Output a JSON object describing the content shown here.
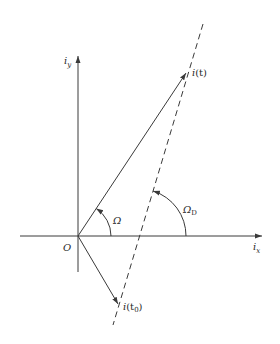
{
  "diagram": {
    "type": "phasor-vector-diagram",
    "colors": {
      "line": "#3a3a3a",
      "text": "#2a2a2a",
      "background": "#ffffff"
    },
    "axes": {
      "x_label": {
        "main": "i",
        "sub": "x"
      },
      "y_label": {
        "main": "i",
        "sub": "y"
      },
      "origin_label": "O"
    },
    "vectors": [
      {
        "id": "i_t",
        "label_main": "i",
        "label_rest": "(t)"
      },
      {
        "id": "i_t0",
        "label_main": "i",
        "label_rest": "(t",
        "label_sub": "0",
        "label_close": ")"
      }
    ],
    "angles": [
      {
        "id": "omega",
        "label": "Ω"
      },
      {
        "id": "omega_d",
        "label": "Ω",
        "sub": "D"
      }
    ],
    "dashed_line": {
      "description": "locus line through i(t0) and i(t)"
    }
  }
}
